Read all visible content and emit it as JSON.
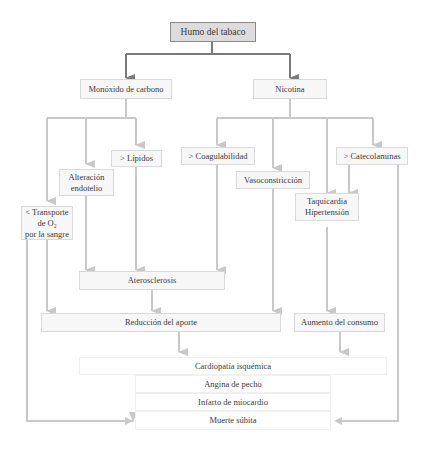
{
  "diagram": {
    "root": "Humo del tabaco",
    "level1": {
      "co": "Monóxido de carbono",
      "nicotina": "Nicotina"
    },
    "effects": {
      "transporte": "< Transporte\nde O₂\npor la sangre",
      "alteracion": "Alteración\nendotelio",
      "lipidos": "> Lípidos",
      "coagulabilidad": "> Coagulabilidad",
      "vasoconstriccion": "Vasoconstricción",
      "taquicardia": "Taquicardia\nHipertensión",
      "catecolaminas": "> Catecolaminas"
    },
    "intermediate": {
      "aterosclerosis": "Aterosclerosis",
      "reduccion": "Reducción del aporte",
      "aumento": "Aumento del consumo"
    },
    "outcomes": [
      "Cardiopatía isquémica",
      "Angina de pecho",
      "Infarto de miocardio",
      "Muerte súbita"
    ],
    "colors": {
      "root_fill": "#dcdcdc",
      "root_arrow": "#7a7a7a",
      "arrow": "#c8c8c8",
      "node_fill": "#f7f7f7"
    }
  }
}
